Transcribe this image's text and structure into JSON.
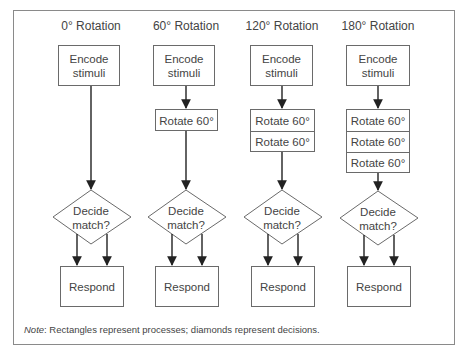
{
  "diagram": {
    "cut_off_heading": "Sequence of processing stages",
    "columns": [
      {
        "title": "0° Rotation",
        "encode_label_line1": "Encode",
        "encode_label_line2": "stimuli",
        "rotate_steps": [],
        "decide_line1": "Decide",
        "decide_line2": "match?",
        "respond_label": "Respond"
      },
      {
        "title": "60° Rotation",
        "encode_label_line1": "Encode",
        "encode_label_line2": "stimuli",
        "rotate_steps": [
          "Rotate 60°"
        ],
        "decide_line1": "Decide",
        "decide_line2": "match?",
        "respond_label": "Respond"
      },
      {
        "title": "120° Rotation",
        "encode_label_line1": "Encode",
        "encode_label_line2": "stimuli",
        "rotate_steps": [
          "Rotate 60°",
          "Rotate 60°"
        ],
        "decide_line1": "Decide",
        "decide_line2": "match?",
        "respond_label": "Respond"
      },
      {
        "title": "180° Rotation",
        "encode_label_line1": "Encode",
        "encode_label_line2": "stimuli",
        "rotate_steps": [
          "Rotate 60°",
          "Rotate 60°",
          "Rotate 60°"
        ],
        "decide_line1": "Decide",
        "decide_line2": "match?",
        "respond_label": "Respond"
      }
    ],
    "note": {
      "prefix": "Note",
      "text": ": Rectangles represent processes; diamonds represent decisions."
    },
    "colors": {
      "stroke": "#6a6a6a",
      "arrow": "#222222",
      "frame": "#8a8a8a",
      "text": "#444444"
    }
  }
}
